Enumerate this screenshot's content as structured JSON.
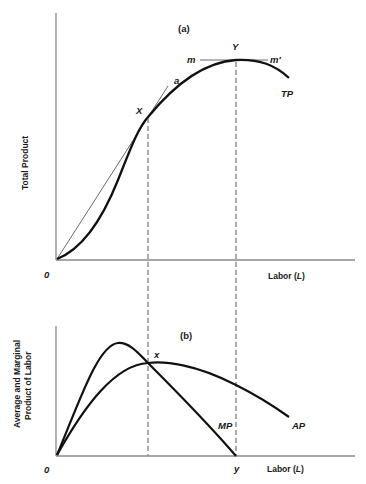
{
  "panel_a": {
    "tag": "(a)",
    "y_axis_label": "Total Product",
    "x_axis_label_prefix": "Labor (",
    "x_axis_label_var": "L",
    "x_axis_label_suffix": ")",
    "origin_label": "0",
    "points": {
      "X": "X",
      "Y": "Y"
    },
    "ray_label": "a",
    "tangent_labels": {
      "left": "m",
      "right": "m′"
    },
    "curve_label": "TP"
  },
  "panel_b": {
    "tag": "(b)",
    "y_axis_label_line1": "Average and Marginal",
    "y_axis_label_line2": "Product of Labor",
    "x_axis_label_prefix": "Labor (",
    "x_axis_label_var": "L",
    "x_axis_label_suffix": ")",
    "origin_label": "0",
    "intersection_label": "x",
    "mp_zero_label": "y",
    "mp_label": "MP",
    "ap_label": "AP"
  },
  "caption": "",
  "colors": {
    "curve": "#111111",
    "axis": "#888888",
    "thin": "#444444"
  }
}
